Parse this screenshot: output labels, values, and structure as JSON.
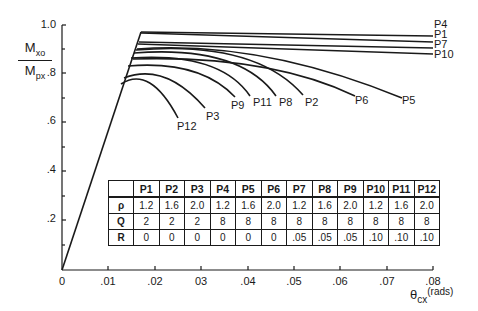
{
  "chart_data": {
    "type": "line",
    "title": "",
    "xlabel": "θcx (rads)",
    "ylabel": "Mxo / Mpx",
    "xlim": [
      0,
      0.08
    ],
    "ylim": [
      0,
      1.0
    ],
    "x_ticks": [
      "0",
      ".01",
      ".02",
      "03",
      ".04",
      ".05",
      ".06",
      ".07",
      ".08"
    ],
    "y_ticks": [
      "0",
      ".2",
      ".4",
      ".6",
      ".8",
      "1.0"
    ],
    "grid": false,
    "legend": "inline curve labels",
    "series": [
      {
        "name": "P4",
        "x": [
          0,
          0.017,
          0.08
        ],
        "y": [
          0,
          0.97,
          0.955
        ]
      },
      {
        "name": "P1",
        "x": [
          0,
          0.017,
          0.08
        ],
        "y": [
          0,
          0.965,
          0.94
        ]
      },
      {
        "name": "P7",
        "x": [
          0,
          0.017,
          0.08
        ],
        "y": [
          0,
          0.93,
          0.905
        ]
      },
      {
        "name": "P10",
        "x": [
          0,
          0.016,
          0.08
        ],
        "y": [
          0,
          0.925,
          0.88
        ]
      },
      {
        "name": "P5",
        "x": [
          0,
          0.016,
          0.03,
          0.05,
          0.073
        ],
        "y": [
          0,
          0.9,
          0.89,
          0.84,
          0.7
        ]
      },
      {
        "name": "P6",
        "x": [
          0,
          0.0155,
          0.03,
          0.045,
          0.063
        ],
        "y": [
          0,
          0.86,
          0.86,
          0.81,
          0.71
        ]
      },
      {
        "name": "P2",
        "x": [
          0,
          0.016,
          0.03,
          0.04,
          0.0475
        ],
        "y": [
          0,
          0.9,
          0.88,
          0.82,
          0.71
        ]
      },
      {
        "name": "P8",
        "x": [
          0,
          0.0155,
          0.028,
          0.037,
          0.0425
        ],
        "y": [
          0,
          0.88,
          0.87,
          0.81,
          0.71
        ]
      },
      {
        "name": "P11",
        "x": [
          0,
          0.015,
          0.025,
          0.032,
          0.037
        ],
        "y": [
          0,
          0.87,
          0.85,
          0.79,
          0.71
        ]
      },
      {
        "name": "P9",
        "x": [
          0,
          0.014,
          0.022,
          0.028,
          0.034
        ],
        "y": [
          0,
          0.83,
          0.82,
          0.78,
          0.72
        ]
      },
      {
        "name": "P3",
        "x": [
          0,
          0.013,
          0.018,
          0.024,
          0.029
        ],
        "y": [
          0,
          0.79,
          0.8,
          0.75,
          0.66
        ]
      },
      {
        "name": "P12",
        "x": [
          0,
          0.0125,
          0.017,
          0.021,
          0.0225
        ],
        "y": [
          0,
          0.76,
          0.78,
          0.72,
          0.62
        ]
      }
    ],
    "table": {
      "columns": [
        "",
        "P1",
        "P2",
        "P3",
        "P4",
        "P5",
        "P6",
        "P7",
        "P8",
        "P9",
        "P10",
        "P11",
        "P12"
      ],
      "rows": [
        [
          "ρ",
          "1.2",
          "1.6",
          "2.0",
          "1.2",
          "1.6",
          "2.0",
          "1.2",
          "1.6",
          "2.0",
          "1.2",
          "1.6",
          "2.0"
        ],
        [
          "Q",
          "2",
          "2",
          "2",
          "8",
          "8",
          "8",
          "8",
          "8",
          "8",
          "8",
          "8",
          "8"
        ],
        [
          "R",
          "0",
          "0",
          "0",
          "0",
          "0",
          "0",
          ".05",
          ".05",
          ".05",
          ".10",
          ".10",
          ".10"
        ]
      ]
    }
  },
  "axes": {
    "ylabel_num": "M",
    "ylabel_num_sub": "xo",
    "ylabel_den": "M",
    "ylabel_den_sub": "px",
    "xlabel_main": "θ",
    "xlabel_sub": "cx",
    "xlabel_unit": "(rads)",
    "y_ticks": [
      {
        "label": "1.0",
        "top": 18
      },
      {
        "label": ".8",
        "top": 66
      },
      {
        "label": ".6",
        "top": 114
      },
      {
        "label": ".4",
        "top": 163
      },
      {
        "label": ".2",
        "top": 212
      }
    ],
    "x_ticks": [
      {
        "label": "0",
        "left": 47
      },
      {
        "label": ".01",
        "left": 93
      },
      {
        "label": ".02",
        "left": 140
      },
      {
        "label": "03",
        "left": 186
      },
      {
        "label": ".04",
        "left": 233
      },
      {
        "label": ".05",
        "left": 279
      },
      {
        "label": ".06",
        "left": 325
      },
      {
        "label": ".07",
        "left": 372
      },
      {
        "label": ".08",
        "left": 418
      }
    ]
  },
  "curve_labels": [
    {
      "text": "P4",
      "left": 434,
      "top": 19
    },
    {
      "text": "P1",
      "left": 434,
      "top": 29
    },
    {
      "text": "P7",
      "left": 434,
      "top": 39
    },
    {
      "text": "P10",
      "left": 434,
      "top": 49
    },
    {
      "text": "P5",
      "left": 402,
      "top": 95
    },
    {
      "text": "P6",
      "left": 355,
      "top": 95
    },
    {
      "text": "P2",
      "left": 305,
      "top": 97
    },
    {
      "text": "P8",
      "left": 279,
      "top": 97
    },
    {
      "text": "P11",
      "left": 253,
      "top": 97
    },
    {
      "text": "P9",
      "left": 231,
      "top": 100
    },
    {
      "text": "P3",
      "left": 206,
      "top": 111
    },
    {
      "text": "P12",
      "left": 177,
      "top": 121
    }
  ]
}
